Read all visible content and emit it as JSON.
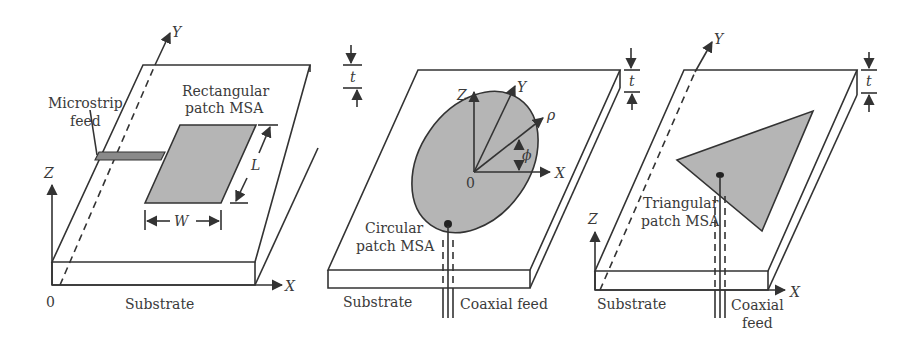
{
  "figure": {
    "panels": [
      {
        "id": "rectangular",
        "patch_label_line1": "Rectangular",
        "patch_label_line2": "patch MSA",
        "feed_label_line1": "Microstrip",
        "feed_label_line2": "feed",
        "substrate_label": "Substrate",
        "dim_width": "W",
        "dim_length": "L",
        "dim_thickness": "t",
        "origin_label": "0",
        "axis_x": "X",
        "axis_y": "Y",
        "axis_z": "Z"
      },
      {
        "id": "circular",
        "patch_label_line1": "Circular",
        "patch_label_line2": "patch MSA",
        "substrate_label": "Substrate",
        "feed_label": "Coaxial feed",
        "dim_thickness": "t",
        "origin_label": "0",
        "axis_x": "X",
        "axis_y": "Y",
        "axis_z": "Z",
        "radial_label": "ρ",
        "angle_label": "ϕ"
      },
      {
        "id": "triangular",
        "patch_label_line1": "Triangular",
        "patch_label_line2": "patch MSA",
        "substrate_label": "Substrate",
        "feed_label_line1": "Coaxial",
        "feed_label_line2": "feed",
        "dim_thickness": "t",
        "axis_x": "X",
        "axis_y": "Y",
        "axis_z": "Z"
      }
    ],
    "colors": {
      "line": "#333333",
      "patch_fill": "#b5b5b5",
      "feed_fill": "#8a8a8a",
      "text": "#3a3a3a"
    }
  }
}
